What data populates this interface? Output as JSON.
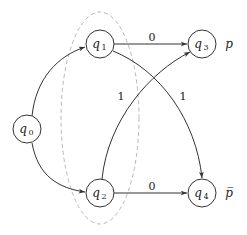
{
  "diagram": {
    "type": "automaton",
    "nodes": [
      {
        "id": "q0",
        "base": "q",
        "sub": "0",
        "x": 27,
        "y": 129
      },
      {
        "id": "q1",
        "base": "q",
        "sub": "1",
        "x": 100,
        "y": 44
      },
      {
        "id": "q2",
        "base": "q",
        "sub": "2",
        "x": 100,
        "y": 193
      },
      {
        "id": "q3",
        "base": "q",
        "sub": "3",
        "x": 202,
        "y": 44
      },
      {
        "id": "q4",
        "base": "q",
        "sub": "4",
        "x": 202,
        "y": 193
      }
    ],
    "edges": [
      {
        "from": "q0",
        "to": "q1",
        "label": ""
      },
      {
        "from": "q0",
        "to": "q2",
        "label": ""
      },
      {
        "from": "q1",
        "to": "q3",
        "label": "0"
      },
      {
        "from": "q1",
        "to": "q4",
        "label": "1"
      },
      {
        "from": "q2",
        "to": "q3",
        "label": "1"
      },
      {
        "from": "q2",
        "to": "q4",
        "label": "0"
      }
    ],
    "propositions": {
      "q3": "p",
      "q4": "p̅"
    },
    "group": {
      "members": [
        "q1",
        "q2"
      ],
      "style": "dashed-ellipse"
    }
  }
}
